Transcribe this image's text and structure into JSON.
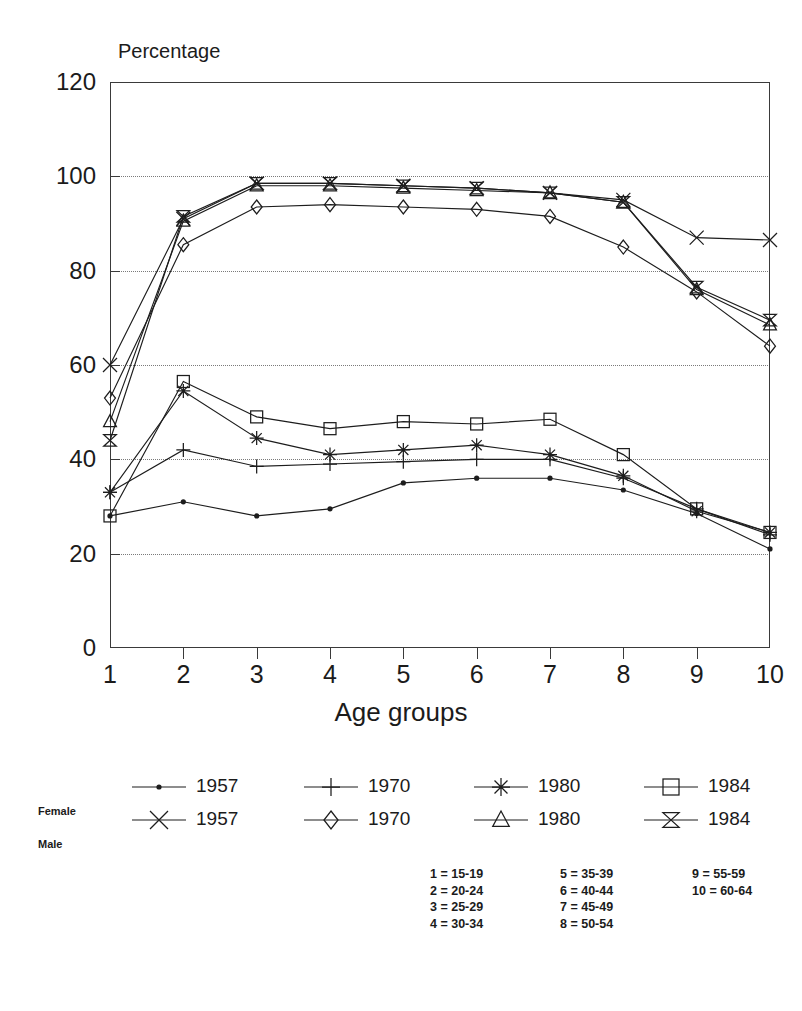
{
  "title": "",
  "axes": {
    "y_label": "Percentage",
    "x_label": "Age groups",
    "y_ticks": [
      "0",
      "20",
      "40",
      "60",
      "80",
      "100",
      "120"
    ],
    "x_ticks": [
      "1",
      "2",
      "3",
      "4",
      "5",
      "6",
      "7",
      "8",
      "9",
      "10"
    ]
  },
  "legend": {
    "female_label": "Female",
    "male_label": "Male",
    "female_items": [
      {
        "year": "1957",
        "marker": "dot-marker"
      },
      {
        "year": "1970",
        "marker": "plus-marker"
      },
      {
        "year": "1980",
        "marker": "asterisk-marker"
      },
      {
        "year": "1984",
        "marker": "square-marker"
      }
    ],
    "male_items": [
      {
        "year": "1957",
        "marker": "cross-marker"
      },
      {
        "year": "1970",
        "marker": "diamond-marker"
      },
      {
        "year": "1980",
        "marker": "triangle-marker"
      },
      {
        "year": "1984",
        "marker": "bowtie-marker"
      }
    ]
  },
  "age_key": {
    "col1": [
      "1 = 15-19",
      "2 = 20-24",
      "3 = 25-29",
      "4 = 30-34"
    ],
    "col2": [
      "5 = 35-39",
      "6 = 40-44",
      "7 = 45-49",
      "8 = 50-54"
    ],
    "col3": [
      "9 = 55-59",
      "10 = 60-64"
    ]
  },
  "chart_data": {
    "type": "line",
    "title": "",
    "xlabel": "Age groups",
    "ylabel": "Percentage",
    "ylim": [
      0,
      120
    ],
    "grid": true,
    "legend_position": "below",
    "categories": [
      "1",
      "2",
      "3",
      "4",
      "5",
      "6",
      "7",
      "8",
      "9",
      "10"
    ],
    "category_definitions": {
      "1": "15-19",
      "2": "20-24",
      "3": "25-29",
      "4": "30-34",
      "5": "35-39",
      "6": "40-44",
      "7": "45-49",
      "8": "50-54",
      "9": "55-59",
      "10": "60-64"
    },
    "series": [
      {
        "name": "Male 1957",
        "sex": "Male",
        "year": "1957",
        "marker": "cross-marker",
        "values": [
          60.0,
          91.0,
          98.5,
          98.5,
          98.0,
          97.5,
          96.5,
          95.0,
          87.0,
          86.5
        ]
      },
      {
        "name": "Male 1970",
        "sex": "Male",
        "year": "1970",
        "marker": "diamond-marker",
        "values": [
          53.0,
          85.5,
          93.5,
          94.0,
          93.5,
          93.0,
          91.5,
          85.0,
          75.5,
          64.0
        ]
      },
      {
        "name": "Male 1980",
        "sex": "Male",
        "year": "1980",
        "marker": "triangle-marker",
        "values": [
          48.0,
          90.5,
          98.0,
          98.0,
          97.5,
          97.0,
          96.5,
          94.5,
          76.0,
          68.5
        ]
      },
      {
        "name": "Male 1984",
        "sex": "Male",
        "year": "1984",
        "marker": "bowtie-marker",
        "values": [
          44.0,
          91.5,
          98.5,
          98.5,
          98.0,
          97.5,
          96.5,
          94.5,
          76.5,
          69.5
        ]
      },
      {
        "name": "Female 1957",
        "sex": "Female",
        "year": "1957",
        "marker": "dot-marker",
        "values": [
          28.0,
          31.0,
          28.0,
          29.5,
          35.0,
          36.0,
          36.0,
          33.5,
          28.5,
          21.0
        ]
      },
      {
        "name": "Female 1970",
        "sex": "Female",
        "year": "1970",
        "marker": "plus-marker",
        "values": [
          33.0,
          42.0,
          38.5,
          39.0,
          39.5,
          40.0,
          40.0,
          36.0,
          29.5,
          24.0
        ]
      },
      {
        "name": "Female 1980",
        "sex": "Female",
        "year": "1980",
        "marker": "asterisk-marker",
        "values": [
          33.0,
          54.5,
          44.5,
          41.0,
          42.0,
          43.0,
          41.0,
          36.5,
          29.0,
          24.5
        ]
      },
      {
        "name": "Female 1984",
        "sex": "Female",
        "year": "1984",
        "marker": "square-marker",
        "values": [
          28.0,
          56.5,
          49.0,
          46.5,
          48.0,
          47.5,
          48.5,
          41.0,
          29.5,
          24.5
        ]
      }
    ]
  }
}
